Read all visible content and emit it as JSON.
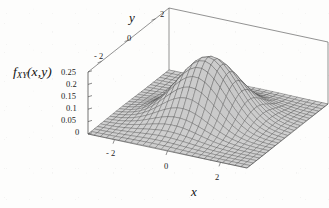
{
  "figure": {
    "kind": "3d-surface-plot",
    "background_color": "#fdfdfc",
    "line_color": "#4a4a4a",
    "surface_fill_light": "#c9c9c9",
    "surface_fill_dark": "#6e6e6e"
  },
  "labels": {
    "z_axis_title_f": "f",
    "z_axis_title_sub": "XY",
    "z_axis_title_args": "(x,y)",
    "x_axis_title": "x",
    "y_axis_title": "y"
  },
  "chart_data": {
    "type": "surface",
    "title": "",
    "xlabel": "x",
    "ylabel": "y",
    "zlabel": "f_XY(x,y)",
    "xlim": [
      -3,
      3
    ],
    "ylim": [
      -3,
      3
    ],
    "zlim": [
      0,
      0.25
    ],
    "xticks": [
      -2,
      0,
      2
    ],
    "xticklabels": [
      "- 2",
      "0",
      "2"
    ],
    "yticks": [
      -2,
      0,
      2
    ],
    "yticklabels": [
      "- 2",
      "0",
      "2"
    ],
    "zticks": [
      0,
      0.05,
      0.1,
      0.15,
      0.2,
      0.25
    ],
    "zticklabels": [
      "0",
      "0.05",
      "0.1",
      "0.15",
      "0.2",
      "0.25"
    ],
    "grid": false,
    "legend": "none",
    "function": "bivariate-normal-pdf",
    "peak": {
      "x": 0,
      "y": 0,
      "z": 0.25
    },
    "params": {
      "mu_x": 0,
      "mu_y": 0,
      "sigma_x": 1,
      "sigma_y": 1,
      "rho": 0.2,
      "amplitude": 0.25
    },
    "mesh": {
      "n_x": 26,
      "n_y": 26
    },
    "view": {
      "azimuth_deg": 38,
      "elevation_deg": 26
    }
  }
}
